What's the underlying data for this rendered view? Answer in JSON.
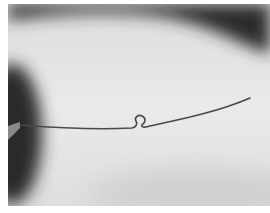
{
  "image": {
    "subject": "thin metal wire with a small omega-shaped loop bent into it, held by a tool at the left edge",
    "style": "grayscale photograph",
    "colors": {
      "background_light": "#e6e6e6",
      "shadow_dark": "#2a2a2a",
      "wire": "#4a4a4a",
      "border": "#ffffff"
    }
  }
}
